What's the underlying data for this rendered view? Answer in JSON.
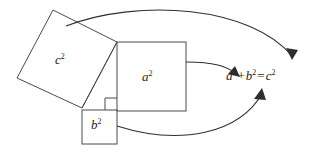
{
  "figure": {
    "stroke_color": "#4a4a4a",
    "text_color": "#1d1d1d",
    "background_color": "#ffffff",
    "stroke_width": 1
  },
  "labels": {
    "c_square": {
      "base": "c",
      "exponent": "2"
    },
    "a_square": {
      "base": "a",
      "exponent": "2"
    },
    "b_square": {
      "base": "b",
      "exponent": "2"
    }
  },
  "equation": {
    "full_text": "a2 + b2 = c2",
    "a_base": "a",
    "a_exp": "2",
    "plus": "+",
    "b_base": "b",
    "b_exp": "2",
    "equals": "=",
    "c_base": "c",
    "c_exp": "2"
  },
  "shapes": {
    "c_square_points": "53,10 117,42 82,108 17,78",
    "a_square": {
      "x": 117,
      "y": 42,
      "w": 69,
      "h": 69
    },
    "b_square": {
      "x": 82,
      "y": 110,
      "w": 35,
      "h": 34
    },
    "right_angle_marker": "105,110 105,98 117,98",
    "triangle_hypotenuse": "82,108 117,42"
  },
  "arrows": {
    "c_to_equation": {
      "name": "arrow-c-square-to-c-term",
      "path": "M 66,26 C 140,-2 250,6 292,56",
      "head": "292,60 286,48 298,50"
    },
    "a_to_equation": {
      "name": "arrow-a-square-to-a-term",
      "path": "M 186,62 C 214,62 226,66 237,74",
      "head": "240,77 228,74 235,66"
    },
    "b_to_equation": {
      "name": "arrow-b-square-to-b-term",
      "path": "M 117,126 C 180,146 240,134 263,92",
      "head": "262,88 254,99 266,100"
    }
  }
}
